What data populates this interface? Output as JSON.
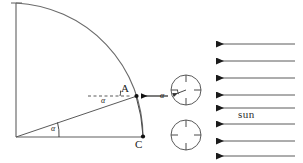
{
  "figure": {
    "background_color": "#ffffff",
    "stroke_color": "#4a4a4a",
    "dark_stroke_color": "#1a1a1a",
    "width": 303,
    "height": 163
  },
  "labels": {
    "point_a": "A",
    "point_c": "C",
    "angle_upper": "α",
    "angle_lower": "α",
    "angle_circle": "α",
    "sun": "sun"
  },
  "geometry": {
    "origin": {
      "x": 16,
      "y": 137
    },
    "vertical_axis": {
      "x1": 16,
      "y1": 3,
      "x2": 16,
      "y2": 137
    },
    "baseline": {
      "x1": 16,
      "y1": 137,
      "x2": 143,
      "y2": 137
    },
    "arc": {
      "start_x": 16,
      "start_y": 3,
      "end_x": 143,
      "end_y": 137,
      "radius": 134,
      "description": "quarter circle arc from top of vertical axis to point C"
    },
    "point_a": {
      "x": 136,
      "y": 96
    },
    "point_c": {
      "x": 143,
      "y": 137
    },
    "radius_line": {
      "x1": 16,
      "y1": 137,
      "x2": 136,
      "y2": 96
    },
    "dashed_horizontal": {
      "x1": 88,
      "y1": 96,
      "x2": 133,
      "y2": 96
    },
    "arrow_a_to_circle": {
      "x1": 166,
      "y1": 96,
      "x2": 139,
      "y2": 96
    },
    "chord_a_to_c": {
      "x1": 136,
      "y1": 96,
      "x2": 143,
      "y2": 137
    }
  },
  "circles": [
    {
      "name": "upper-circle",
      "cx": 186,
      "cy": 90,
      "r": 15,
      "has_crosshair_ticks": true,
      "has_inner_arrow": true,
      "inner_arrow": {
        "x1": 186,
        "y1": 90,
        "x2": 172,
        "y2": 95
      }
    },
    {
      "name": "lower-circle",
      "cx": 186,
      "cy": 135,
      "r": 15,
      "has_crosshair_ticks": true,
      "has_inner_arrow": false
    }
  ],
  "sun_rays": {
    "count": 8,
    "label": "sun",
    "label_x": 243,
    "label_y": 113,
    "x_start": 295,
    "x_end": 211,
    "arrow_direction": "left",
    "y_positions": [
      44,
      61,
      78,
      95,
      112,
      127,
      142,
      157
    ],
    "color": "#5a5a5a"
  }
}
